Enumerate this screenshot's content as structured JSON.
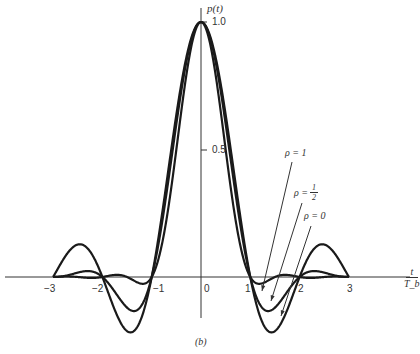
{
  "chart_data": {
    "type": "line",
    "title": "",
    "xlabel": "t / T_b",
    "ylabel": "p(t)",
    "caption": "(b)",
    "xlim": [
      -3,
      3
    ],
    "ylim": [
      -0.3,
      1.05
    ],
    "grid": false,
    "x_ticks": [
      "-3",
      "-2",
      "-1",
      "0",
      "1",
      "2",
      "3"
    ],
    "y_ticks": [
      "0.5",
      "1.0"
    ],
    "series": [
      {
        "name": "ρ = 0",
        "rolloff": 0,
        "x": [
          -3,
          -2.5,
          -2,
          -1.5,
          -1,
          -0.5,
          0,
          0.5,
          1,
          1.5,
          2,
          2.5,
          3
        ],
        "values": [
          0,
          0.127,
          0,
          -0.212,
          0,
          0.637,
          1.0,
          0.637,
          0,
          -0.212,
          0,
          0.127,
          0
        ]
      },
      {
        "name": "ρ = 1/2",
        "rolloff": 0.5,
        "x": [
          -3,
          -2.5,
          -2,
          -1.5,
          -1,
          -0.5,
          0,
          0.5,
          1,
          1.5,
          2,
          2.5,
          3
        ],
        "values": [
          0,
          0.01,
          0,
          -0.12,
          0,
          0.72,
          1.0,
          0.72,
          0,
          -0.12,
          0,
          0.01,
          0
        ]
      },
      {
        "name": "ρ = 1",
        "rolloff": 1,
        "x": [
          -3,
          -2.5,
          -2,
          -1.5,
          -1,
          -0.5,
          0,
          0.5,
          1,
          1.5,
          2,
          2.5,
          3
        ],
        "values": [
          0,
          0.02,
          0,
          -0.03,
          0,
          0.5,
          1.0,
          0.5,
          0,
          -0.03,
          0,
          0.02,
          0
        ]
      }
    ],
    "annotations": [
      "ρ = 1",
      "ρ = 1/2",
      "ρ = 0"
    ]
  },
  "labels": {
    "y_axis": "p(t)",
    "y_tick_1": "1.0",
    "y_tick_05": "0.5",
    "x_tick_m3": "−3",
    "x_tick_m2": "−2",
    "x_tick_m1": "−1",
    "x_tick_0": "0",
    "x_tick_1": "1",
    "x_tick_2": "2",
    "x_tick_3": "3",
    "x_axis_num": "t",
    "x_axis_den": "T_b",
    "rho1": "ρ = 1",
    "rho_half_prefix": "ρ =",
    "rho_half_num": "1",
    "rho_half_den": "2",
    "rho0": "ρ = 0",
    "caption": "(b)"
  }
}
